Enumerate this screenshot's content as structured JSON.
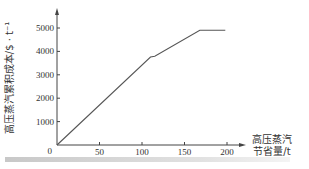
{
  "chart_data": {
    "type": "line",
    "title": "",
    "xlabel": "高压蒸汽节省量/t",
    "xlabel_lines": [
      "高压蒸汽",
      "节省量/t"
    ],
    "ylabel": "高压蒸汽累积成本/$ · t⁻¹",
    "x_ticks": [
      0,
      50,
      100,
      150,
      200
    ],
    "y_ticks": [
      1000,
      2000,
      3000,
      4000,
      5000
    ],
    "origin_label": "0",
    "xlim": [
      0,
      220
    ],
    "ylim": [
      0,
      5400
    ],
    "grid": false,
    "legend": null,
    "series": [
      {
        "name": "cumulative cost",
        "x": [
          0,
          110,
          115,
          168,
          198
        ],
        "y": [
          0,
          3760,
          3790,
          4900,
          4900
        ]
      }
    ],
    "colors": {
      "line": "#555555",
      "axis": "#444444"
    }
  }
}
